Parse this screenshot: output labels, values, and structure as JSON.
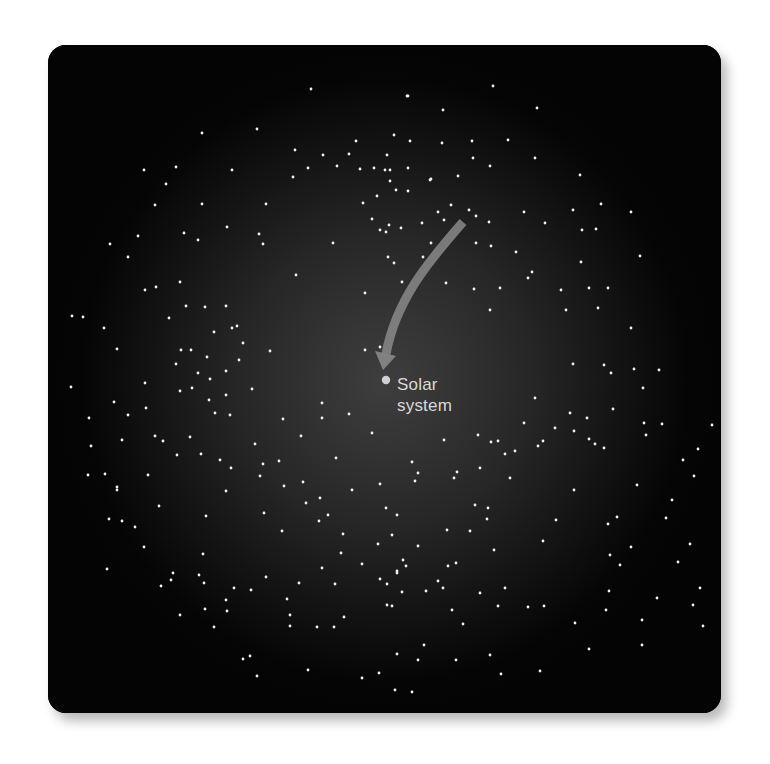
{
  "figure": {
    "label_line1": "Solar",
    "label_line2": "system",
    "colors": {
      "background": "#040404",
      "glow_center": "#3e3e3e",
      "star": "#f2f2f2",
      "arrow": "#8a8a8a",
      "label": "#d9d9d9",
      "sun_marker": "#d0d0d0"
    },
    "solar_system_position": [
      386,
      380
    ],
    "arrow": {
      "from": [
        460,
        226
      ],
      "to": [
        384,
        368
      ]
    }
  },
  "stars": [
    [
      311,
      89
    ],
    [
      407,
      96
    ],
    [
      493,
      86
    ],
    [
      537,
      108
    ],
    [
      202,
      133
    ],
    [
      257,
      129
    ],
    [
      232,
      170
    ],
    [
      295,
      150
    ],
    [
      323,
      155
    ],
    [
      349,
      154
    ],
    [
      356,
      141
    ],
    [
      308,
      168
    ],
    [
      293,
      177
    ],
    [
      337,
      166
    ],
    [
      360,
      169
    ],
    [
      374,
      168
    ],
    [
      385,
      170
    ],
    [
      390,
      181
    ],
    [
      377,
      196
    ],
    [
      266,
      204
    ],
    [
      202,
      204
    ],
    [
      227,
      227
    ],
    [
      198,
      240
    ],
    [
      184,
      233
    ],
    [
      166,
      184
    ],
    [
      176,
      167
    ],
    [
      144,
      170
    ],
    [
      155,
      205
    ],
    [
      408,
      96
    ],
    [
      443,
      110
    ],
    [
      394,
      135
    ],
    [
      410,
      141
    ],
    [
      442,
      143
    ],
    [
      508,
      140
    ],
    [
      472,
      141
    ],
    [
      387,
      155
    ],
    [
      408,
      168
    ],
    [
      473,
      158
    ],
    [
      431,
      179
    ],
    [
      535,
      158
    ],
    [
      408,
      191
    ],
    [
      390,
      170
    ],
    [
      396,
      190
    ],
    [
      430,
      180
    ],
    [
      458,
      176
    ],
    [
      524,
      212
    ],
    [
      573,
      210
    ],
    [
      580,
      175
    ],
    [
      490,
      166
    ],
    [
      451,
      205
    ],
    [
      363,
      203
    ],
    [
      372,
      219
    ],
    [
      389,
      225
    ],
    [
      380,
      230
    ],
    [
      401,
      228
    ],
    [
      422,
      223
    ],
    [
      431,
      243
    ],
    [
      438,
      212
    ],
    [
      476,
      216
    ],
    [
      489,
      222
    ],
    [
      545,
      223
    ],
    [
      582,
      230
    ],
    [
      596,
      229
    ],
    [
      601,
      204
    ],
    [
      476,
      243
    ],
    [
      528,
      278
    ],
    [
      581,
      262
    ],
    [
      631,
      212
    ],
    [
      640,
      256
    ],
    [
      128,
      257
    ],
    [
      110,
      244
    ],
    [
      83,
      317
    ],
    [
      104,
      328
    ],
    [
      138,
      236
    ],
    [
      117,
      349
    ],
    [
      145,
      290
    ],
    [
      180,
      282
    ],
    [
      156,
      287
    ],
    [
      169,
      318
    ],
    [
      186,
      306
    ],
    [
      176,
      364
    ],
    [
      181,
      350
    ],
    [
      214,
      332
    ],
    [
      226,
      306
    ],
    [
      207,
      357
    ],
    [
      232,
      328
    ],
    [
      205,
      307
    ],
    [
      237,
      326
    ],
    [
      210,
      379
    ],
    [
      198,
      373
    ],
    [
      191,
      350
    ],
    [
      226,
      371
    ],
    [
      252,
      389
    ],
    [
      270,
      351
    ],
    [
      226,
      395
    ],
    [
      230,
      415
    ],
    [
      239,
      360
    ],
    [
      243,
      343
    ],
    [
      263,
      244
    ],
    [
      259,
      234
    ],
    [
      296,
      275
    ],
    [
      333,
      243
    ],
    [
      365,
      293
    ],
    [
      380,
      347
    ],
    [
      365,
      350
    ],
    [
      394,
      263
    ],
    [
      386,
      232
    ],
    [
      402,
      282
    ],
    [
      388,
      257
    ],
    [
      469,
      210
    ],
    [
      423,
      257
    ],
    [
      444,
      220
    ],
    [
      491,
      246
    ],
    [
      474,
      289
    ],
    [
      516,
      252
    ],
    [
      446,
      283
    ],
    [
      532,
      272
    ],
    [
      561,
      290
    ],
    [
      500,
      288
    ],
    [
      490,
      310
    ],
    [
      566,
      310
    ],
    [
      589,
      288
    ],
    [
      608,
      288
    ],
    [
      631,
      328
    ],
    [
      598,
      308
    ],
    [
      634,
      369
    ],
    [
      573,
      364
    ],
    [
      611,
      373
    ],
    [
      659,
      370
    ],
    [
      643,
      388
    ],
    [
      604,
      365
    ],
    [
      535,
      398
    ],
    [
      524,
      423
    ],
    [
      570,
      413
    ],
    [
      543,
      441
    ],
    [
      515,
      451
    ],
    [
      478,
      435
    ],
    [
      454,
      478
    ],
    [
      505,
      454
    ],
    [
      72,
      316
    ],
    [
      71,
      387
    ],
    [
      89,
      418
    ],
    [
      88,
      475
    ],
    [
      117,
      487
    ],
    [
      148,
      475
    ],
    [
      155,
      436
    ],
    [
      114,
      402
    ],
    [
      145,
      383
    ],
    [
      122,
      440
    ],
    [
      146,
      408
    ],
    [
      163,
      441
    ],
    [
      180,
      391
    ],
    [
      192,
      388
    ],
    [
      209,
      400
    ],
    [
      190,
      437
    ],
    [
      215,
      413
    ],
    [
      201,
      454
    ],
    [
      177,
      455
    ],
    [
      220,
      460
    ],
    [
      226,
      491
    ],
    [
      231,
      468
    ],
    [
      255,
      444
    ],
    [
      263,
      464
    ],
    [
      279,
      461
    ],
    [
      284,
      486
    ],
    [
      264,
      513
    ],
    [
      282,
      531
    ],
    [
      306,
      503
    ],
    [
      320,
      498
    ],
    [
      322,
      403
    ],
    [
      322,
      418
    ],
    [
      349,
      414
    ],
    [
      283,
      419
    ],
    [
      301,
      436
    ],
    [
      260,
      476
    ],
    [
      303,
      482
    ],
    [
      336,
      458
    ],
    [
      352,
      490
    ],
    [
      372,
      433
    ],
    [
      386,
      508
    ],
    [
      397,
      515
    ],
    [
      380,
      484
    ],
    [
      412,
      462
    ],
    [
      444,
      440
    ],
    [
      418,
      473
    ],
    [
      457,
      472
    ],
    [
      480,
      468
    ],
    [
      491,
      442
    ],
    [
      510,
      478
    ],
    [
      498,
      441
    ],
    [
      538,
      446
    ],
    [
      555,
      428
    ],
    [
      574,
      431
    ],
    [
      587,
      418
    ],
    [
      613,
      409
    ],
    [
      644,
      423
    ],
    [
      662,
      424
    ],
    [
      646,
      435
    ],
    [
      589,
      439
    ],
    [
      637,
      485
    ],
    [
      604,
      448
    ],
    [
      666,
      518
    ],
    [
      631,
      547
    ],
    [
      475,
      505
    ],
    [
      470,
      531
    ],
    [
      556,
      520
    ],
    [
      447,
      530
    ],
    [
      443,
      588
    ],
    [
      505,
      588
    ],
    [
      494,
      550
    ],
    [
      426,
      591
    ],
    [
      418,
      546
    ],
    [
      456,
      563
    ],
    [
      487,
      519
    ],
    [
      480,
      593
    ],
    [
      543,
      541
    ],
    [
      574,
      490
    ],
    [
      595,
      444
    ],
    [
      617,
      517
    ],
    [
      608,
      524
    ],
    [
      488,
      508
    ],
    [
      415,
      481
    ],
    [
      397,
      573
    ],
    [
      403,
      560
    ],
    [
      392,
      535
    ],
    [
      378,
      544
    ],
    [
      343,
      534
    ],
    [
      319,
      521
    ],
    [
      328,
      515
    ],
    [
      341,
      553
    ],
    [
      335,
      584
    ],
    [
      344,
      617
    ],
    [
      299,
      583
    ],
    [
      266,
      577
    ],
    [
      287,
      599
    ],
    [
      251,
      590
    ],
    [
      290,
      615
    ],
    [
      322,
      568
    ],
    [
      203,
      554
    ],
    [
      107,
      569
    ],
    [
      171,
      580
    ],
    [
      206,
      516
    ],
    [
      159,
      506
    ],
    [
      135,
      527
    ],
    [
      161,
      586
    ],
    [
      234,
      588
    ],
    [
      226,
      600
    ],
    [
      290,
      626
    ],
    [
      317,
      627
    ],
    [
      334,
      627
    ],
    [
      362,
      564
    ],
    [
      387,
      584
    ],
    [
      397,
      571
    ],
    [
      448,
      566
    ],
    [
      406,
      566
    ],
    [
      392,
      606
    ],
    [
      452,
      610
    ],
    [
      463,
      624
    ],
    [
      380,
      579
    ],
    [
      438,
      581
    ],
    [
      498,
      606
    ],
    [
      490,
      655
    ],
    [
      528,
      607
    ],
    [
      544,
      606
    ],
    [
      610,
      555
    ],
    [
      642,
      620
    ],
    [
      642,
      645
    ],
    [
      657,
      598
    ],
    [
      693,
      605
    ],
    [
      703,
      626
    ],
    [
      620,
      565
    ],
    [
      690,
      544
    ],
    [
      700,
      588
    ],
    [
      712,
      425
    ],
    [
      694,
      476
    ],
    [
      698,
      449
    ],
    [
      678,
      562
    ],
    [
      575,
      623
    ],
    [
      589,
      649
    ],
    [
      501,
      674
    ],
    [
      456,
      660
    ],
    [
      424,
      645
    ],
    [
      397,
      654
    ],
    [
      402,
      592
    ],
    [
      387,
      605
    ],
    [
      418,
      660
    ],
    [
      412,
      692
    ],
    [
      362,
      678
    ],
    [
      308,
      670
    ],
    [
      257,
      676
    ],
    [
      214,
      627
    ],
    [
      204,
      583
    ],
    [
      205,
      609
    ],
    [
      250,
      656
    ],
    [
      227,
      611
    ],
    [
      109,
      519
    ],
    [
      105,
      474
    ],
    [
      117,
      490
    ],
    [
      91,
      446
    ],
    [
      128,
      415
    ],
    [
      122,
      521
    ],
    [
      144,
      547
    ],
    [
      173,
      573
    ],
    [
      199,
      575
    ],
    [
      180,
      615
    ],
    [
      243,
      659
    ],
    [
      379,
      673
    ],
    [
      395,
      690
    ],
    [
      540,
      671
    ],
    [
      606,
      610
    ],
    [
      609,
      591
    ],
    [
      672,
      500
    ],
    [
      683,
      460
    ]
  ]
}
